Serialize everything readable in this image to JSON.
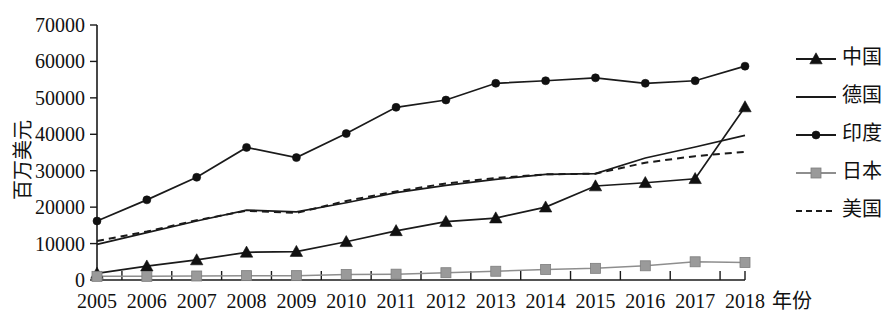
{
  "chart_data": {
    "type": "line",
    "title": "",
    "xlabel": "年份",
    "ylabel": "百万美元",
    "categories": [
      "2005",
      "2006",
      "2007",
      "2008",
      "2009",
      "2010",
      "2011",
      "2012",
      "2013",
      "2014",
      "2015",
      "2016",
      "2017",
      "2018"
    ],
    "x": [
      2005,
      2006,
      2007,
      2008,
      2009,
      2010,
      2011,
      2012,
      2013,
      2014,
      2015,
      2016,
      2017,
      2018
    ],
    "xlim": [
      2005,
      2018
    ],
    "ylim": [
      0,
      70000
    ],
    "y_ticks": [
      0,
      10000,
      20000,
      30000,
      40000,
      50000,
      60000,
      70000
    ],
    "y_tick_labels": [
      "0",
      "10000",
      "20000",
      "30000",
      "40000",
      "50000",
      "60000",
      "70000"
    ],
    "grid": false,
    "legend_position": "right",
    "series": [
      {
        "name": "中国",
        "marker": "triangle",
        "line_style": "solid",
        "color": "#111111",
        "values": [
          1800,
          3800,
          5500,
          7600,
          7800,
          10500,
          13500,
          16000,
          17000,
          20000,
          25800,
          26700,
          27800,
          47500
        ]
      },
      {
        "name": "德国",
        "marker": "none",
        "line_style": "solid",
        "color": "#1a1a1a",
        "values": [
          9800,
          13000,
          16200,
          19200,
          18700,
          21200,
          24000,
          26000,
          27600,
          29000,
          29200,
          33500,
          36500,
          39700
        ]
      },
      {
        "name": "印度",
        "marker": "circle",
        "line_style": "solid",
        "color": "#111111",
        "values": [
          16200,
          22000,
          28200,
          36400,
          33600,
          40200,
          47400,
          49400,
          54000,
          54700,
          55500,
          54000,
          54700,
          58700
        ]
      },
      {
        "name": "日本",
        "marker": "square",
        "line_style": "solid",
        "color": "#9a9a9a",
        "values": [
          1000,
          1000,
          1100,
          1200,
          1200,
          1500,
          1600,
          2000,
          2400,
          2900,
          3200,
          3900,
          5000,
          4800
        ]
      },
      {
        "name": "美国",
        "marker": "none",
        "line_style": "dashed",
        "color": "#1a1a1a",
        "values": [
          10700,
          13300,
          16400,
          19000,
          18400,
          21700,
          24300,
          26500,
          28000,
          29000,
          29200,
          32200,
          34000,
          35200
        ]
      }
    ]
  },
  "legend": {
    "items": [
      {
        "label": "中国",
        "marker": "triangle",
        "style": "solid"
      },
      {
        "label": "德国",
        "marker": "none",
        "style": "solid"
      },
      {
        "label": "印度",
        "marker": "circle",
        "style": "solid"
      },
      {
        "label": "日本",
        "marker": "square",
        "style": "solid"
      },
      {
        "label": "美国",
        "marker": "none",
        "style": "dashed"
      }
    ]
  },
  "axes": {
    "y_title": "百万美元",
    "x_title": "年份"
  }
}
